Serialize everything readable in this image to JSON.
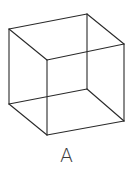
{
  "figure": {
    "label": "A",
    "line_color": "#2a2a2a",
    "background": "#ffffff"
  },
  "cube": {
    "vertices": {
      "back_top_left": [
        9,
        29
      ],
      "back_top_right": [
        87,
        14
      ],
      "back_bottom_left": [
        9,
        104
      ],
      "back_bottom_right": [
        87,
        89
      ],
      "front_top_left": [
        47,
        60
      ],
      "front_top_right": [
        124,
        44
      ],
      "front_bottom_left": [
        47,
        135
      ],
      "front_bottom_right": [
        124,
        121
      ]
    },
    "edges": [
      [
        "back_top_left",
        "back_top_right"
      ],
      [
        "back_top_left",
        "back_bottom_left"
      ],
      [
        "back_top_right",
        "back_bottom_right"
      ],
      [
        "back_bottom_left",
        "back_bottom_right"
      ],
      [
        "front_top_left",
        "front_top_right"
      ],
      [
        "front_top_left",
        "front_bottom_left"
      ],
      [
        "front_top_right",
        "front_bottom_right"
      ],
      [
        "front_bottom_left",
        "front_bottom_right"
      ],
      [
        "back_top_left",
        "front_top_left"
      ],
      [
        "back_top_right",
        "front_top_right"
      ],
      [
        "back_bottom_left",
        "front_bottom_left"
      ],
      [
        "back_bottom_right",
        "front_bottom_right"
      ]
    ]
  }
}
